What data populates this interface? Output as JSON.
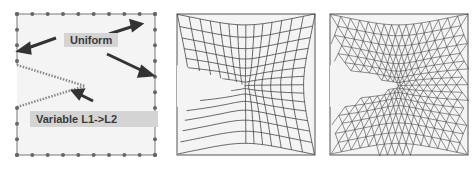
{
  "figure": {
    "panels": [
      {
        "id": "seeding",
        "description": "Edge seeding on square domain with V-notch crack",
        "labels": [
          {
            "text": "Uniform"
          },
          {
            "text": "Variable L1->L2"
          }
        ]
      },
      {
        "id": "quad-mesh",
        "description": "Quadrilateral mesh refined toward crack tip"
      },
      {
        "id": "tri-mesh",
        "description": "Triangular mesh refined toward crack tip"
      }
    ],
    "colors": {
      "background": "#f4f4f4",
      "mesh_line": "#555555",
      "label_bg": "#d4d4d4",
      "arrow": "#333333"
    }
  }
}
